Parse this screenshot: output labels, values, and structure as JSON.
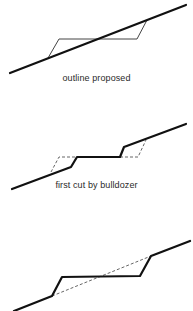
{
  "colors": {
    "ground": "#111111",
    "outline": "#444444",
    "dashed": "#555555",
    "text": "#2a2a2a"
  },
  "panels": [
    {
      "id": "outline-proposed",
      "caption": "outline proposed",
      "caption_y": 73,
      "ground_line": [
        [
          10,
          73
        ],
        [
          186,
          5
        ]
      ],
      "proposed_outline": [
        [
          48,
          58
        ],
        [
          59,
          39
        ],
        [
          137,
          39
        ],
        [
          147,
          20
        ]
      ]
    },
    {
      "id": "first-cut",
      "caption": "first cut by bulldozer",
      "caption_y": 180,
      "ground_profile": [
        [
          12,
          189
        ],
        [
          71,
          167
        ],
        [
          77,
          157
        ],
        [
          120,
          157
        ],
        [
          124,
          147
        ],
        [
          186,
          124
        ]
      ],
      "dashed_outline_left": [
        [
          51,
          172
        ],
        [
          59,
          157
        ],
        [
          77,
          157
        ]
      ],
      "dashed_outline_right": [
        [
          120,
          157
        ],
        [
          138,
          157
        ],
        [
          146,
          140
        ]
      ]
    },
    {
      "id": "final-cut",
      "caption": "",
      "ground_profile": [
        [
          14,
          311
        ],
        [
          52,
          296
        ],
        [
          62,
          277
        ],
        [
          140,
          276
        ],
        [
          151,
          256
        ],
        [
          190,
          241
        ]
      ],
      "original_ground_dashed": [
        [
          52,
          296
        ],
        [
          151,
          256
        ]
      ]
    }
  ]
}
